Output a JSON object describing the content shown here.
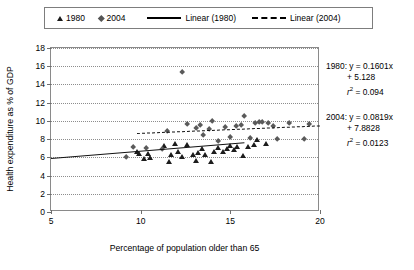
{
  "legend": {
    "items": [
      {
        "label": "1980",
        "marker": "triangle-marker"
      },
      {
        "label": "2004",
        "marker": "diamond-marker"
      },
      {
        "label": "Linear (1980)",
        "marker": "solid-line"
      },
      {
        "label": "Linear (2004)",
        "marker": "dashed-line"
      }
    ]
  },
  "annotations": {
    "a1980": {
      "line1": "1980: y = 0.1601x",
      "line2": "+ 5.128",
      "line3_pre": "r",
      "line3_sup": "2",
      "line3_post": " = 0.094"
    },
    "a2004": {
      "line1": "2004: y = 0.0819x",
      "line2": "+ 7.8828",
      "line3_pre": "r",
      "line3_sup": "2",
      "line3_post": " = 0.0123"
    }
  },
  "chart_data": {
    "type": "scatter",
    "title": "",
    "xlabel": "Percentage of population older than 65",
    "ylabel": "Health expenditure as % of GDP",
    "xlim": [
      5,
      20
    ],
    "ylim": [
      0,
      18
    ],
    "xticks": [
      5,
      10,
      15,
      20
    ],
    "yticks": [
      0,
      2,
      4,
      6,
      8,
      10,
      12,
      14,
      16,
      18
    ],
    "grid": "horizontal-dotted",
    "legend_position": "top",
    "series": [
      {
        "name": "1980",
        "marker": "triangle",
        "color": "#1c1c1c",
        "points": [
          [
            9.8,
            6.6
          ],
          [
            9.9,
            6.4
          ],
          [
            10.2,
            5.9
          ],
          [
            10.4,
            6.4
          ],
          [
            10.5,
            6.0
          ],
          [
            11.3,
            7.3
          ],
          [
            11.6,
            5.5
          ],
          [
            11.7,
            6.3
          ],
          [
            11.9,
            7.5
          ],
          [
            12.1,
            6.6
          ],
          [
            12.3,
            6.1
          ],
          [
            12.6,
            7.4
          ],
          [
            12.9,
            6.3
          ],
          [
            13.1,
            5.6
          ],
          [
            13.2,
            6.5
          ],
          [
            13.4,
            7.0
          ],
          [
            13.6,
            6.3
          ],
          [
            13.9,
            5.5
          ],
          [
            14.1,
            6.6
          ],
          [
            14.3,
            7.1
          ],
          [
            14.6,
            6.6
          ],
          [
            14.8,
            6.9
          ],
          [
            15.0,
            7.3
          ],
          [
            15.2,
            6.8
          ],
          [
            15.4,
            7.2
          ],
          [
            15.7,
            6.2
          ],
          [
            16.0,
            7.2
          ],
          [
            16.3,
            7.4
          ],
          [
            16.5,
            7.9
          ],
          [
            17.0,
            7.5
          ]
        ]
      },
      {
        "name": "2004",
        "marker": "diamond",
        "color": "#5a5a5a",
        "points": [
          [
            9.2,
            6.0
          ],
          [
            9.6,
            7.1
          ],
          [
            10.3,
            7.0
          ],
          [
            11.2,
            6.9
          ],
          [
            11.5,
            8.9
          ],
          [
            12.3,
            15.4
          ],
          [
            12.6,
            9.6
          ],
          [
            13.1,
            9.2
          ],
          [
            13.3,
            9.5
          ],
          [
            13.5,
            8.4
          ],
          [
            13.8,
            9.1
          ],
          [
            14.0,
            10.0
          ],
          [
            14.3,
            7.8
          ],
          [
            14.7,
            9.3
          ],
          [
            15.0,
            8.2
          ],
          [
            15.3,
            9.4
          ],
          [
            15.6,
            9.5
          ],
          [
            15.8,
            10.5
          ],
          [
            16.1,
            8.1
          ],
          [
            16.4,
            9.8
          ],
          [
            16.6,
            9.9
          ],
          [
            16.8,
            9.9
          ],
          [
            17.1,
            9.7
          ],
          [
            17.4,
            9.4
          ],
          [
            17.6,
            8.0
          ],
          [
            18.3,
            9.7
          ],
          [
            19.1,
            8.0
          ],
          [
            19.4,
            9.6
          ]
        ]
      }
    ],
    "fits": [
      {
        "name": "Linear (1980)",
        "style": "solid",
        "slope": 0.1601,
        "intercept": 5.128,
        "r2": 0.094,
        "x_start": 5.0,
        "x_end": 15.8
      },
      {
        "name": "Linear (2004)",
        "style": "dashed",
        "slope": 0.0819,
        "intercept": 7.8828,
        "r2": 0.0123,
        "x_start": 9.8,
        "x_end": 20.0
      }
    ]
  }
}
